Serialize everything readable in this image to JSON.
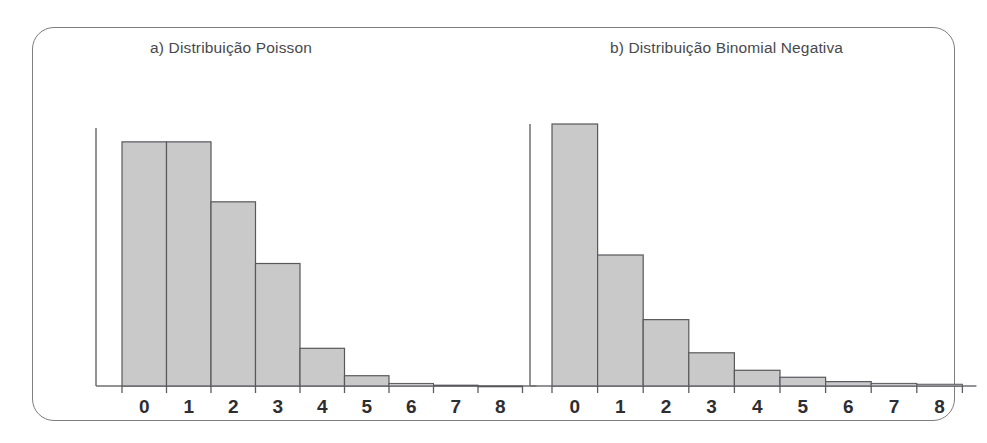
{
  "figure": {
    "background_color": "#ffffff",
    "frame_color": "#7d7d82",
    "bar_fill_color": "#c9c9c9",
    "bar_stroke_color": "#58585c",
    "axis_color": "#6f6f74",
    "title_color": "#49494d",
    "tick_label_color": "#2e2e31"
  },
  "panels": {
    "a": {
      "title": "a) Distribuição Poisson"
    },
    "b": {
      "title": "b) Distribuição Binomial Negativa"
    }
  },
  "chart_data": [
    {
      "type": "bar",
      "id": "poisson",
      "title": "a) Distribuição Poisson",
      "xlabel": "",
      "ylabel": "",
      "grid": false,
      "legend": "none",
      "axis_ticks_visible": true,
      "y_axis_labels_visible": false,
      "categories": [
        "0",
        "1",
        "2",
        "3",
        "4",
        "5",
        "6",
        "7",
        "8"
      ],
      "values": [
        0.285,
        0.285,
        0.215,
        0.143,
        0.044,
        0.012,
        0.003,
        0.001,
        0.0
      ],
      "ylim": [
        0,
        0.3
      ],
      "xlim": [
        -0.5,
        8.5
      ],
      "tick_labels": [
        "0",
        "1",
        "2",
        "3",
        "4",
        "5",
        "6",
        "7",
        "8"
      ]
    },
    {
      "type": "bar",
      "id": "binomial-negativa",
      "title": "b) Distribuição Binomial Negativa",
      "xlabel": "",
      "ylabel": "",
      "grid": false,
      "legend": "none",
      "axis_ticks_visible": true,
      "y_axis_labels_visible": false,
      "categories": [
        "0",
        "1",
        "2",
        "3",
        "4",
        "5",
        "6",
        "7",
        "8"
      ],
      "values": [
        0.3,
        0.15,
        0.076,
        0.038,
        0.018,
        0.01,
        0.005,
        0.003,
        0.002
      ],
      "ylim": [
        0,
        0.3
      ],
      "xlim": [
        -0.5,
        8.5
      ],
      "tick_labels": [
        "0",
        "1",
        "2",
        "3",
        "4",
        "5",
        "6",
        "7",
        "8"
      ]
    }
  ]
}
